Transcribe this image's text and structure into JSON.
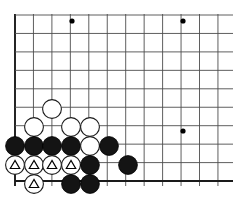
{
  "app": {
    "title": "Go Board Diagram",
    "board_type": "go-board",
    "description": "Go game position, lower-left corner"
  },
  "board": {
    "size": 19,
    "visible_columns": 12,
    "visible_rows": 10,
    "origin_x": 15,
    "origin_y": 15,
    "cell": 18.45,
    "line_color": "#4d4d4d",
    "edge_color": "#1a1a1a",
    "background": "#ffffff",
    "left_edge_x": 15,
    "bottom_edge_y": 186,
    "right_clip_x": 233,
    "top_clip_y": 14
  },
  "star_points": [
    {
      "x": 72,
      "y": 21,
      "r": 2.6,
      "name": "star-point-top-left"
    },
    {
      "x": 183,
      "y": 21,
      "r": 2.6,
      "name": "star-point-top-right"
    },
    {
      "x": 183,
      "y": 131,
      "r": 2.6,
      "name": "star-point-center-right"
    }
  ],
  "stone_radius": 9.4,
  "stones": [
    {
      "id": "w1",
      "color": "white",
      "x": 52,
      "y": 109,
      "mark": "none"
    },
    {
      "id": "w2",
      "color": "white",
      "x": 34,
      "y": 127,
      "mark": "none"
    },
    {
      "id": "w3",
      "color": "white",
      "x": 71,
      "y": 127,
      "mark": "none"
    },
    {
      "id": "w4",
      "color": "white",
      "x": 90,
      "y": 127,
      "mark": "none"
    },
    {
      "id": "b1",
      "color": "black",
      "x": 15,
      "y": 146,
      "mark": "none"
    },
    {
      "id": "b2",
      "color": "black",
      "x": 34,
      "y": 146,
      "mark": "none"
    },
    {
      "id": "b3",
      "color": "black",
      "x": 52,
      "y": 146,
      "mark": "none"
    },
    {
      "id": "b4",
      "color": "black",
      "x": 71,
      "y": 146,
      "mark": "none"
    },
    {
      "id": "w5",
      "color": "white",
      "x": 90,
      "y": 146,
      "mark": "none"
    },
    {
      "id": "b5",
      "color": "black",
      "x": 109,
      "y": 146,
      "mark": "none"
    },
    {
      "id": "wt1",
      "color": "white",
      "x": 15,
      "y": 165,
      "mark": "triangle"
    },
    {
      "id": "wt2",
      "color": "white",
      "x": 34,
      "y": 165,
      "mark": "triangle"
    },
    {
      "id": "wt3",
      "color": "white",
      "x": 52,
      "y": 165,
      "mark": "triangle"
    },
    {
      "id": "wt4",
      "color": "white",
      "x": 71,
      "y": 165,
      "mark": "triangle"
    },
    {
      "id": "b6",
      "color": "black",
      "x": 90,
      "y": 165,
      "mark": "none"
    },
    {
      "id": "b7",
      "color": "black",
      "x": 128,
      "y": 165,
      "mark": "none"
    },
    {
      "id": "wt5",
      "color": "white",
      "x": 34,
      "y": 184,
      "mark": "triangle"
    },
    {
      "id": "b8",
      "color": "black",
      "x": 71,
      "y": 184,
      "mark": "none"
    },
    {
      "id": "b9",
      "color": "black",
      "x": 90,
      "y": 184,
      "mark": "none"
    }
  ],
  "legend": {
    "triangle_meaning": "marked white stones",
    "black_label": "black stone",
    "white_label": "white stone"
  }
}
